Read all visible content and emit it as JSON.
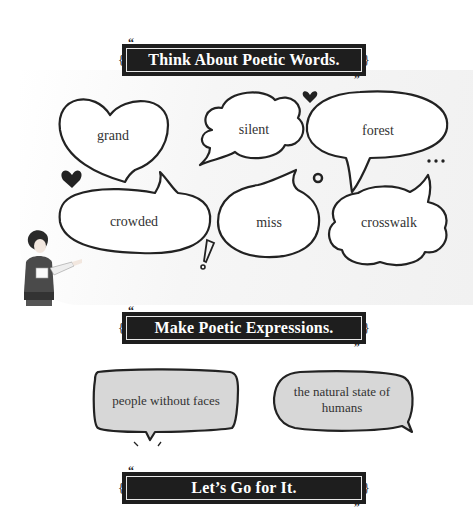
{
  "sections": {
    "think": {
      "title": "Think About Poetic Words."
    },
    "make": {
      "title": "Make Poetic Expressions."
    },
    "go": {
      "title": "Let’s Go for It."
    }
  },
  "quote_marks": {
    "open": "“",
    "close": "”"
  },
  "words": [
    "grand",
    "silent",
    "forest",
    "crowded",
    "miss",
    "crosswalk"
  ],
  "expressions": [
    "people without faces",
    "the natural state of humans"
  ],
  "expressions_lines": {
    "second_line1": "the natural state of",
    "second_line2": "humans"
  },
  "decorations": {
    "ellipsis": "•••",
    "exclamation": "!"
  },
  "colors": {
    "banner_bg": "#1e1e1e",
    "banner_text": "#ffffff",
    "bubble_stroke": "#222222",
    "expression_fill": "#d7d7d7"
  }
}
